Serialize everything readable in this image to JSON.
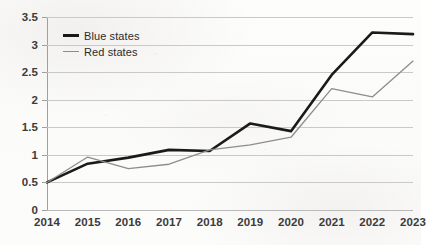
{
  "chart_data": {
    "type": "line",
    "title": "",
    "subtitle": "",
    "xlabel": "",
    "ylabel": "",
    "categories": [
      "2014",
      "2015",
      "2016",
      "2017",
      "2018",
      "2019",
      "2020",
      "2021",
      "2022",
      "2023"
    ],
    "x": [
      2014,
      2015,
      2016,
      2017,
      2018,
      2019,
      2020,
      2021,
      2022,
      2023
    ],
    "series": [
      {
        "name": "Blue states",
        "color": "#1a1a1a",
        "values": [
          0.5,
          0.84,
          0.95,
          1.09,
          1.07,
          1.57,
          1.43,
          2.45,
          3.22,
          3.19
        ]
      },
      {
        "name": "Red states",
        "color": "#8d8d8d",
        "values": [
          0.5,
          0.96,
          0.75,
          0.83,
          1.09,
          1.18,
          1.32,
          2.2,
          2.05,
          2.7
        ]
      }
    ],
    "ylim": [
      0,
      3.5
    ],
    "ytick_values": [
      0,
      0.5,
      1,
      1.5,
      2,
      2.5,
      3,
      3.5
    ],
    "ytick_labels": [
      "0",
      "0.5",
      "1",
      "1.5",
      "2",
      "2.5",
      "3",
      "3.5"
    ],
    "grid": true,
    "grid_axis": "y",
    "legend_position": "upper-left-inside",
    "legend": [
      "Blue states",
      "Red states"
    ]
  },
  "legend": {
    "items": [
      {
        "label": "Blue states",
        "swatch": "line-swatch-black"
      },
      {
        "label": "Red states",
        "swatch": "line-swatch-gray"
      }
    ]
  },
  "colors": {
    "blue_states_line": "#1a1a1a",
    "red_states_line": "#8d8d8d",
    "gridline": "#c9c9c9",
    "axis": "#9f9f9f",
    "tick_label": "#3b3b3b",
    "background": "#fcfcfb"
  }
}
